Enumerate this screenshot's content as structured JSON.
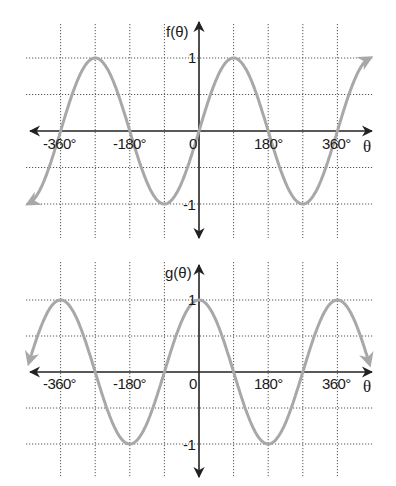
{
  "chart_data": [
    {
      "type": "line",
      "title": "",
      "function": "sin",
      "ylabel": "f(θ)",
      "xlabel": "θ",
      "x_ticks": [
        "-360°",
        "-180°",
        "0",
        "180°",
        "360°"
      ],
      "y_ticks": [
        "1",
        "-1"
      ],
      "xlim": [
        -405,
        405
      ],
      "ylim": [
        -1.1,
        1.1
      ],
      "x_gridlines": [
        -360,
        -270,
        -180,
        -90,
        0,
        90,
        180,
        270,
        360
      ],
      "y_gridlines": [
        1,
        0.5,
        0,
        -0.5,
        -1
      ],
      "grid": true,
      "series": [
        {
          "name": "f(θ) = sin θ",
          "x": [
            -360,
            -270,
            -180,
            -90,
            0,
            90,
            180,
            270,
            360
          ],
          "values": [
            0,
            1,
            0,
            -1,
            0,
            1,
            0,
            -1,
            0
          ],
          "arrows_at_ends": true,
          "color": "#a8a8a8"
        }
      ]
    },
    {
      "type": "line",
      "title": "",
      "function": "cos",
      "ylabel": "g(θ)",
      "xlabel": "θ",
      "x_ticks": [
        "-360°",
        "-180°",
        "0",
        "180°",
        "360°"
      ],
      "y_ticks": [
        "1",
        "-1"
      ],
      "xlim": [
        -405,
        405
      ],
      "ylim": [
        -1.1,
        1.1
      ],
      "x_gridlines": [
        -360,
        -270,
        -180,
        -90,
        0,
        90,
        180,
        270,
        360
      ],
      "y_gridlines": [
        1,
        0.5,
        0,
        -0.5,
        -1
      ],
      "grid": true,
      "series": [
        {
          "name": "g(θ) = cos θ",
          "x": [
            -360,
            -270,
            -180,
            -90,
            0,
            90,
            180,
            270,
            360
          ],
          "values": [
            1,
            0,
            -1,
            0,
            1,
            0,
            -1,
            0,
            1
          ],
          "arrows_at_ends": true,
          "color": "#a8a8a8"
        }
      ]
    }
  ],
  "charts": {
    "top": {
      "ylabel": "f(θ)",
      "xlabel": "θ",
      "tick_neg360": "-360°",
      "tick_neg180": "-180°",
      "tick_zero": "0",
      "tick_180": "180°",
      "tick_360": "360°",
      "tick_y1": "1",
      "tick_yneg1": "-1"
    },
    "bottom": {
      "ylabel": "g(θ)",
      "xlabel": "θ",
      "tick_neg360": "-360°",
      "tick_neg180": "-180°",
      "tick_zero": "0",
      "tick_180": "180°",
      "tick_360": "360°",
      "tick_y1": "1",
      "tick_yneg1": "-1"
    }
  }
}
